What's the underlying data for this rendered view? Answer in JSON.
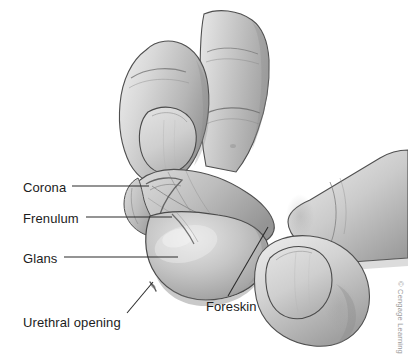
{
  "figure": {
    "kind": "anatomical-illustration",
    "style": "grayscale pencil/airbrush medical drawing",
    "background_color": "#ffffff",
    "width": 408,
    "height": 362
  },
  "labels": {
    "corona": "Corona",
    "frenulum": "Frenulum",
    "glans": "Glans",
    "urethral_opening": "Urethral opening",
    "foreskin": "Foreskin"
  },
  "leader_lines": [
    {
      "name": "corona-leader",
      "from": [
        72,
        186
      ],
      "to": [
        149,
        186
      ]
    },
    {
      "name": "frenulum-leader",
      "from": [
        86,
        217
      ],
      "to": [
        172,
        217
      ]
    },
    {
      "name": "glans-leader",
      "from": [
        64,
        257
      ],
      "to": [
        178,
        257
      ]
    },
    {
      "name": "urethral-leader",
      "from": [
        127,
        313
      ],
      "to": [
        153,
        282
      ]
    },
    {
      "name": "foreskin-leader",
      "from": [
        228,
        296
      ],
      "to": [
        268,
        227
      ]
    }
  ],
  "credit": {
    "text": "© Cengage Learning",
    "color": "#9a9a9a",
    "orientation": "vertical-right-edge"
  },
  "palette": {
    "ink": "#1c1c1c",
    "outline": "#4a4a4a",
    "skin_light": "#e3e3e3",
    "skin_mid": "#c4c4c4",
    "skin_shadow": "#9d9d9d",
    "skin_deep": "#7d7d7d",
    "nail_light": "#dcdcdc",
    "nail_mid": "#c8c8c8"
  },
  "parts": [
    {
      "name": "upper-left-finger",
      "description": "index finger angled down-right with large oval fingernail"
    },
    {
      "name": "upper-right-finger",
      "description": "second finger, vertical, with knuckle creases"
    },
    {
      "name": "right-finger",
      "description": "finger entering from the right edge pressing the shaft"
    },
    {
      "name": "lower-right-thumb",
      "description": "thumb at lower right with broad nail"
    },
    {
      "name": "glans-body",
      "description": "rounded glans penis, center-left, light gray with soft shading"
    },
    {
      "name": "foreskin-fold",
      "description": "retracted foreskin folded back behind the corona"
    },
    {
      "name": "corona-ridge",
      "description": "raised ridge at the base of the glans"
    },
    {
      "name": "frenulum-band",
      "description": "thin band of tissue on the underside of the glans"
    },
    {
      "name": "urethral-slit",
      "description": "small opening at the tip of the glans"
    }
  ]
}
